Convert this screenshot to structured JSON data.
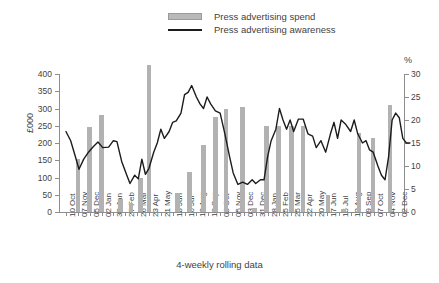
{
  "legend": {
    "items": [
      {
        "label": "Press advertising spend",
        "marker": "bar-swatch",
        "color": "#b2b2b2"
      },
      {
        "label": "Press advertising awareness",
        "marker": "line-swatch",
        "color": "#1c1c1c"
      }
    ]
  },
  "axes": {
    "y_left_label": "£000",
    "y_right_label": "%",
    "x_title": "4-weekly rolling data"
  },
  "chart_data": {
    "type": "bar",
    "title": "",
    "subtitle": "",
    "xlabel": "4-weekly rolling data",
    "ylabel": "£000",
    "y2label": "%",
    "ylim": [
      0,
      400
    ],
    "y2lim": [
      0,
      30
    ],
    "y_ticks": [
      0,
      50,
      100,
      150,
      200,
      250,
      300,
      350,
      400
    ],
    "y2_ticks": [
      0,
      5,
      10,
      15,
      20,
      25,
      30
    ],
    "grid": false,
    "legend_position": "top-center",
    "categories": [
      "10 Oct",
      "07 Nov",
      "05 Dec",
      "02 Jan",
      "30 Jan",
      "27 Feb",
      "26 Mar",
      "23 Apr",
      "21 May",
      "18 Jun",
      "16 Jul",
      "13 Aug",
      "10 Sep",
      "08 Oct",
      "05 Nov",
      "03 Dec",
      "31 Dec",
      "28 Jan",
      "25 Feb",
      "25 Mar",
      "22 Apr",
      "20 May",
      "17 Jun",
      "15 Jul",
      "12 Aug",
      "09 Sep",
      "07 Oct",
      "04 Nov",
      "02 Dec"
    ],
    "tick_labels_shown": [
      "10 Oct",
      "07 Nov",
      "05 Dec",
      "02 Jan",
      "30 Jan",
      "27 Feb",
      "26 Mar",
      "23 Apr",
      "21 May",
      "18 Jun",
      "16 Jul",
      "13 Aug",
      "10 Sep",
      "08 Oct",
      "05 Nov",
      "03 Dec",
      "31 Dec",
      "28 Jan",
      "25 Feb",
      "25 Mar",
      "22 Apr",
      "20 May",
      "17 Jun",
      "15 Jul",
      "12 Aug",
      "09 Sep",
      "07 Oct",
      "04 Nov",
      "02 Dec"
    ],
    "series": [
      {
        "name": "Press advertising spend",
        "type": "bar",
        "axis": "left",
        "unit": "£000",
        "color": "#b2b2b2",
        "values": [
          0,
          155,
          245,
          0,
          280,
          0,
          38,
          0,
          0,
          25,
          0,
          100,
          0,
          0,
          0,
          0,
          0,
          0,
          0,
          0,
          0,
          0,
          0,
          0,
          0,
          0,
          0,
          0,
          0
        ],
        "bars": [
          {
            "x_index": 1.0,
            "value": 155
          },
          {
            "x_index": 2.0,
            "value": 245
          },
          {
            "x_index": 3.0,
            "value": 280
          },
          {
            "x_index": 4.6,
            "value": 38
          },
          {
            "x_index": 5.5,
            "value": 25
          },
          {
            "x_index": 6.3,
            "value": 100
          },
          {
            "x_index": 7.0,
            "value": 425
          },
          {
            "x_index": 9.4,
            "value": 55
          },
          {
            "x_index": 10.4,
            "value": 115
          },
          {
            "x_index": 11.6,
            "value": 195
          },
          {
            "x_index": 12.6,
            "value": 275
          },
          {
            "x_index": 13.5,
            "value": 300
          },
          {
            "x_index": 14.9,
            "value": 305
          },
          {
            "x_index": 15.9,
            "value": 12
          },
          {
            "x_index": 16.9,
            "value": 250
          },
          {
            "x_index": 17.9,
            "value": 250
          },
          {
            "x_index": 19.0,
            "value": 250
          },
          {
            "x_index": 20.0,
            "value": 250
          },
          {
            "x_index": 22.1,
            "value": 50
          },
          {
            "x_index": 23.4,
            "value": 10
          },
          {
            "x_index": 24.7,
            "value": 230
          },
          {
            "x_index": 25.9,
            "value": 215
          },
          {
            "x_index": 27.3,
            "value": 310
          }
        ]
      },
      {
        "name": "Press advertising awareness",
        "type": "line",
        "axis": "right",
        "unit": "%",
        "color": "#1c1c1c",
        "values": [
          17.5,
          15.0,
          11.0,
          9.3,
          12.0,
          14.5,
          15.3,
          14.2,
          14.2,
          14.0,
          15.5,
          15.3,
          11.0,
          7.0,
          8.0,
          11.5,
          8.0,
          10.0,
          15.0,
          19.5,
          17.5,
          16.0,
          18.0,
          20.5,
          26.5,
          27.5,
          24.0,
          22.5,
          15.0
        ],
        "points": [
          {
            "x_index": 0.0,
            "value": 17.5
          },
          {
            "x_index": 0.4,
            "value": 15.5
          },
          {
            "x_index": 0.8,
            "value": 12.0
          },
          {
            "x_index": 1.1,
            "value": 9.3
          },
          {
            "x_index": 1.5,
            "value": 11.5
          },
          {
            "x_index": 1.9,
            "value": 13.0
          },
          {
            "x_index": 2.3,
            "value": 14.2
          },
          {
            "x_index": 2.7,
            "value": 15.2
          },
          {
            "x_index": 3.1,
            "value": 14.0
          },
          {
            "x_index": 3.6,
            "value": 14.1
          },
          {
            "x_index": 4.0,
            "value": 15.5
          },
          {
            "x_index": 4.3,
            "value": 15.3
          },
          {
            "x_index": 4.7,
            "value": 11.0
          },
          {
            "x_index": 5.1,
            "value": 8.2
          },
          {
            "x_index": 5.4,
            "value": 6.2
          },
          {
            "x_index": 5.8,
            "value": 8.0
          },
          {
            "x_index": 6.1,
            "value": 7.2
          },
          {
            "x_index": 6.4,
            "value": 11.5
          },
          {
            "x_index": 6.7,
            "value": 8.2
          },
          {
            "x_index": 7.0,
            "value": 9.5
          },
          {
            "x_index": 7.4,
            "value": 13.0
          },
          {
            "x_index": 7.7,
            "value": 15.0
          },
          {
            "x_index": 8.0,
            "value": 18.0
          },
          {
            "x_index": 8.3,
            "value": 16.0
          },
          {
            "x_index": 8.7,
            "value": 17.5
          },
          {
            "x_index": 9.0,
            "value": 19.5
          },
          {
            "x_index": 9.3,
            "value": 19.8
          },
          {
            "x_index": 9.7,
            "value": 21.5
          },
          {
            "x_index": 10.0,
            "value": 25.5
          },
          {
            "x_index": 10.3,
            "value": 26.0
          },
          {
            "x_index": 10.6,
            "value": 27.5
          },
          {
            "x_index": 11.0,
            "value": 25.0
          },
          {
            "x_index": 11.3,
            "value": 23.5
          },
          {
            "x_index": 11.6,
            "value": 22.5
          },
          {
            "x_index": 11.9,
            "value": 25.0
          },
          {
            "x_index": 12.2,
            "value": 23.5
          },
          {
            "x_index": 12.6,
            "value": 22.0
          },
          {
            "x_index": 13.0,
            "value": 21.5
          },
          {
            "x_index": 13.4,
            "value": 17.0
          },
          {
            "x_index": 13.8,
            "value": 12.0
          },
          {
            "x_index": 14.1,
            "value": 8.5
          },
          {
            "x_index": 14.5,
            "value": 6.0
          },
          {
            "x_index": 14.9,
            "value": 6.5
          },
          {
            "x_index": 15.3,
            "value": 6.0
          },
          {
            "x_index": 15.7,
            "value": 7.0
          },
          {
            "x_index": 16.0,
            "value": 6.2
          },
          {
            "x_index": 16.4,
            "value": 7.0
          },
          {
            "x_index": 16.7,
            "value": 7.0
          },
          {
            "x_index": 17.0,
            "value": 12.0
          },
          {
            "x_index": 17.3,
            "value": 15.5
          },
          {
            "x_index": 17.7,
            "value": 18.0
          },
          {
            "x_index": 18.0,
            "value": 22.5
          },
          {
            "x_index": 18.3,
            "value": 20.0
          },
          {
            "x_index": 18.6,
            "value": 18.0
          },
          {
            "x_index": 18.9,
            "value": 20.0
          },
          {
            "x_index": 19.2,
            "value": 17.5
          },
          {
            "x_index": 19.6,
            "value": 20.2
          },
          {
            "x_index": 20.0,
            "value": 20.2
          },
          {
            "x_index": 20.4,
            "value": 17.0
          },
          {
            "x_index": 20.8,
            "value": 16.5
          },
          {
            "x_index": 21.1,
            "value": 14.0
          },
          {
            "x_index": 21.5,
            "value": 15.5
          },
          {
            "x_index": 21.9,
            "value": 13.0
          },
          {
            "x_index": 22.3,
            "value": 17.0
          },
          {
            "x_index": 22.6,
            "value": 19.5
          },
          {
            "x_index": 22.9,
            "value": 16.0
          },
          {
            "x_index": 23.2,
            "value": 20.0
          },
          {
            "x_index": 23.6,
            "value": 19.0
          },
          {
            "x_index": 24.0,
            "value": 17.5
          },
          {
            "x_index": 24.3,
            "value": 20.0
          },
          {
            "x_index": 24.6,
            "value": 17.0
          },
          {
            "x_index": 25.0,
            "value": 15.0
          },
          {
            "x_index": 25.3,
            "value": 15.5
          },
          {
            "x_index": 25.6,
            "value": 13.5
          },
          {
            "x_index": 25.9,
            "value": 13.0
          },
          {
            "x_index": 26.3,
            "value": 10.0
          },
          {
            "x_index": 26.6,
            "value": 8.0
          },
          {
            "x_index": 26.9,
            "value": 7.0
          },
          {
            "x_index": 27.2,
            "value": 12.0
          },
          {
            "x_index": 27.5,
            "value": 20.0
          },
          {
            "x_index": 27.8,
            "value": 21.5
          },
          {
            "x_index": 28.1,
            "value": 20.5
          },
          {
            "x_index": 28.4,
            "value": 16.0
          },
          {
            "x_index": 28.7,
            "value": 15.0
          },
          {
            "x_index": 29.0,
            "value": 15.0
          }
        ]
      }
    ]
  }
}
